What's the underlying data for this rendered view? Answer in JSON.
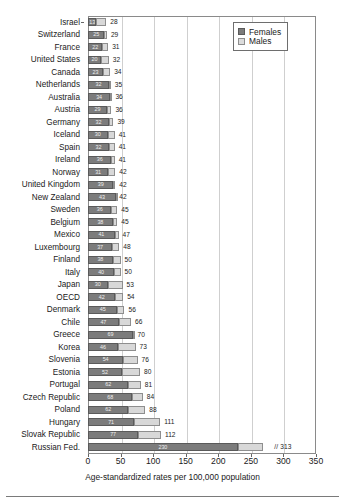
{
  "chart_data": {
    "type": "bar",
    "orientation": "horizontal",
    "stacked": true,
    "title": "",
    "xlabel": "Age-standardized rates per 100,000 population",
    "ylabel": "",
    "xlim": [
      0,
      350
    ],
    "xticks": [
      0,
      50,
      100,
      150,
      200,
      250,
      300,
      350
    ],
    "grid": true,
    "legend_position": "top-right",
    "legend": [
      "Females",
      "Males"
    ],
    "series_colors": {
      "Females": "#7c7c7c",
      "Males": "#d8d8d8"
    },
    "categories": [
      "Israel",
      "Switzerland",
      "France",
      "United States",
      "Canada",
      "Netherlands",
      "Australia",
      "Austria",
      "Germany",
      "Iceland",
      "Spain",
      "Ireland",
      "Norway",
      "United Kingdom",
      "New Zealand",
      "Sweden",
      "Belgium",
      "Mexico",
      "Luxembourg",
      "Finland",
      "Italy",
      "Japan",
      "OECD",
      "Denmark",
      "Chile",
      "Greece",
      "Korea",
      "Slovenia",
      "Estonia",
      "Portugal",
      "Czech Republic",
      "Poland",
      "Hungary",
      "Slovak Republic",
      "Russian Fed."
    ],
    "series": [
      {
        "name": "Females",
        "values": [
          13,
          25,
          22,
          20,
          23,
          32,
          34,
          29,
          32,
          30,
          32,
          36,
          31,
          39,
          43,
          36,
          38,
          41,
          37,
          38,
          40,
          30,
          42,
          45,
          47,
          69,
          46,
          54,
          52,
          62,
          68,
          62,
          71,
          77,
          230
        ]
      },
      {
        "name": "Males",
        "values": [
          28,
          29,
          31,
          32,
          34,
          35,
          36,
          36,
          39,
          41,
          41,
          41,
          42,
          42,
          42,
          45,
          45,
          47,
          48,
          50,
          50,
          53,
          54,
          56,
          66,
          70,
          73,
          76,
          80,
          81,
          84,
          88,
          111,
          112,
          313
        ]
      }
    ],
    "notes": {
      "axis_break_marker": "//",
      "axis_break_row": "Russian Fed.",
      "male_values_are_totals": true
    }
  }
}
